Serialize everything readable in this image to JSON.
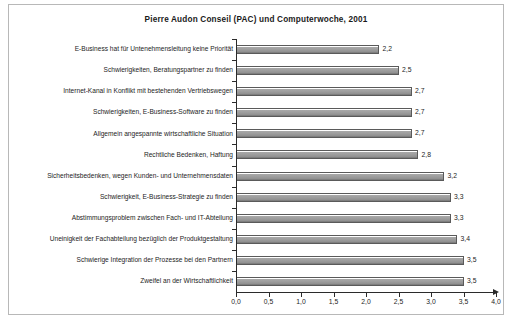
{
  "chart_data": {
    "type": "bar",
    "orientation": "horizontal",
    "title": "Pierre Audon Conseil (PAC) und Computerwoche, 2001",
    "xlabel": "",
    "ylabel": "",
    "xlim": [
      0.0,
      4.0
    ],
    "xticks": [
      0.0,
      0.5,
      1.0,
      1.5,
      2.0,
      2.5,
      3.0,
      3.5,
      4.0
    ],
    "xtick_labels": [
      "0,0",
      "0,5",
      "1,0",
      "1,5",
      "2,0",
      "2,5",
      "3,0",
      "3,5",
      "4,0"
    ],
    "grid": false,
    "legend": null,
    "decimal_separator": ",",
    "bar_color": "#9d9d9d",
    "bar_edge_color": "#5a5a5a",
    "categories": [
      "E-Business hat für Untenehmensleitung keine Priorität",
      "Schwierigkeiten, Beratungspartner zu finden",
      "Internet-Kanal in Konflikt mit bestehenden Vertriebswegen",
      "Schwierigkeiten, E-Business-Software zu finden",
      "Allgemein angespannte wirtschaftliche Situation",
      "Rechtliche Bedenken, Haftung",
      "Sicherheitsbedenken, wegen Kunden- und Unternehmensdaten",
      "Schwierigkeit, E-Business-Strategie zu finden",
      "Abstimmungsproblem zwischen Fach- und IT-Abteilung",
      "Uneinigkeit der Fachabteilung bezüglich der Produktgestaltung",
      "Schwierige Integration der Prozesse bei den Partnern",
      "Zweifel an der Wirtschaftlichkeit"
    ],
    "values": [
      2.2,
      2.5,
      2.7,
      2.7,
      2.7,
      2.8,
      3.2,
      3.3,
      3.3,
      3.4,
      3.5,
      3.5
    ],
    "value_labels": [
      "2,2",
      "2,5",
      "2,7",
      "2,7",
      "2,7",
      "2,8",
      "3,2",
      "3,3",
      "3,3",
      "3,4",
      "3,5",
      "3,5"
    ]
  },
  "caption": ""
}
